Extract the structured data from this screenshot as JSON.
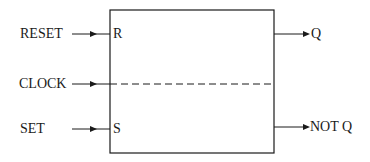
{
  "diagram": {
    "type": "flip-flop block",
    "inputs": [
      {
        "label": "RESET",
        "pin": "R"
      },
      {
        "label": "CLOCK",
        "pin": ""
      },
      {
        "label": "SET",
        "pin": "S"
      }
    ],
    "outputs": [
      {
        "label": "Q"
      },
      {
        "label": "NOT Q"
      }
    ],
    "colors": {
      "line": "#1a1a1a",
      "background": "#ffffff"
    }
  }
}
